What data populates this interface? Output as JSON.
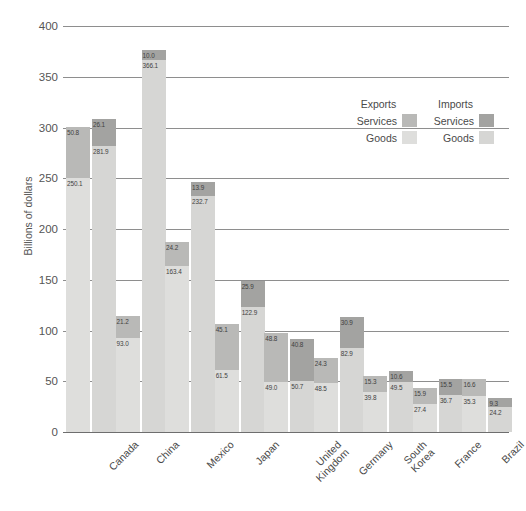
{
  "chart_data": {
    "type": "bar",
    "title": "",
    "subtitle": "",
    "xlabel": "",
    "ylabel": "Billions of dollars",
    "ylim": [
      0,
      400
    ],
    "yticks": [
      0,
      50,
      100,
      150,
      200,
      250,
      300,
      350,
      400
    ],
    "grid": true,
    "stacked": true,
    "legend_position": "upper-right",
    "categories": [
      "Canada",
      "China",
      "Mexico",
      "Japan",
      "United Kingdom",
      "Germany",
      "South Korea",
      "France",
      "Brazil"
    ],
    "series": [
      {
        "name": "Exports Goods",
        "values": [
          250.1,
          93.0,
          163.4,
          61.5,
          49.0,
          48.5,
          39.8,
          27.4,
          35.3
        ],
        "color": "#dededc"
      },
      {
        "name": "Exports Services",
        "values": [
          50.8,
          21.2,
          24.2,
          45.1,
          48.8,
          24.3,
          15.3,
          15.9,
          16.6
        ],
        "color": "#b9b9b7"
      },
      {
        "name": "Imports Goods",
        "values": [
          281.9,
          366.1,
          232.7,
          122.9,
          50.7,
          82.9,
          49.5,
          36.7,
          24.2
        ],
        "color": "#d6d6d4"
      },
      {
        "name": "Imports Services",
        "values": [
          26.1,
          10.0,
          13.9,
          25.9,
          40.8,
          30.9,
          10.6,
          15.5,
          9.3
        ],
        "color": "#a3a3a1"
      }
    ]
  },
  "axis": {
    "y_title": "Billions of dollars",
    "y_tick_labels": [
      "0",
      "50",
      "100",
      "150",
      "200",
      "250",
      "300",
      "350",
      "400"
    ],
    "x_tick_labels": [
      "Canada",
      "China",
      "Mexico",
      "Japan",
      "United Kingdom",
      "Germany",
      "South Korea",
      "France",
      "Brazil"
    ]
  },
  "legend": {
    "exports_title": "Exports",
    "imports_title": "Imports",
    "services_label_exports": "Services",
    "services_label_imports": "Services",
    "goods_label_exports": "Goods",
    "goods_label_imports": "Goods"
  },
  "values_text": {
    "Canada": {
      "exp_goods": "250.1",
      "exp_svc": "50.8",
      "imp_goods": "281.9",
      "imp_svc": "26.1"
    },
    "China": {
      "exp_goods": "93.0",
      "exp_svc": "21.2",
      "imp_goods": "366.1",
      "imp_svc": "10.0"
    },
    "Mexico": {
      "exp_goods": "163.4",
      "exp_svc": "24.2",
      "imp_goods": "232.7",
      "imp_svc": "13.9"
    },
    "Japan": {
      "exp_goods": "61.5",
      "exp_svc": "45.1",
      "imp_goods": "122.9",
      "imp_svc": "25.9"
    },
    "United Kingdom": {
      "exp_goods": "49.0",
      "exp_svc": "48.8",
      "imp_goods": "50.7",
      "imp_svc": "40.8"
    },
    "Germany": {
      "exp_goods": "48.5",
      "exp_svc": "24.3",
      "imp_goods": "82.9",
      "imp_svc": "30.9"
    },
    "South Korea": {
      "exp_goods": "39.8",
      "exp_svc": "15.3",
      "imp_goods": "49.5",
      "imp_svc": "10.6"
    },
    "France": {
      "exp_goods": "27.4",
      "exp_svc": "15.9",
      "imp_goods": "36.7",
      "imp_svc": "15.5"
    },
    "Brazil": {
      "exp_goods": "35.3",
      "exp_svc": "16.6",
      "imp_goods": "24.2",
      "imp_svc": "9.3"
    }
  },
  "colors": {
    "exports_goods": "#dededc",
    "exports_services": "#b9b9b7",
    "imports_goods": "#d6d6d4",
    "imports_services": "#a3a3a1",
    "gridline": "#8e8e8e",
    "text": "#4a4a4a"
  }
}
